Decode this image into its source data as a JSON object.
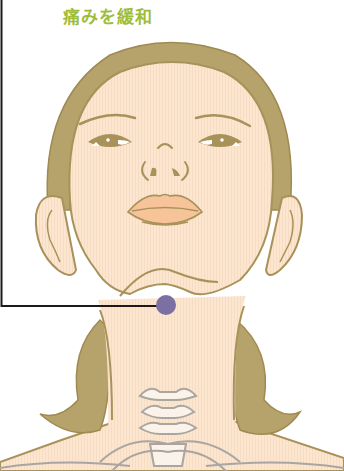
{
  "title": "痛みを緩和",
  "colors": {
    "title": "#9ebd3a",
    "skin": "#fce6d0",
    "outline": "#a8925a",
    "hair": "#b6a36b",
    "lips": "#f7c49a",
    "point": "#7b6fa3",
    "leader_line": "#1a1a1a",
    "bone": "#fbf3ea",
    "bone_outline": "#a9a5a0"
  },
  "acupoint": {
    "label": "acupressure point",
    "cx": 166,
    "cy": 305,
    "r": 10
  }
}
